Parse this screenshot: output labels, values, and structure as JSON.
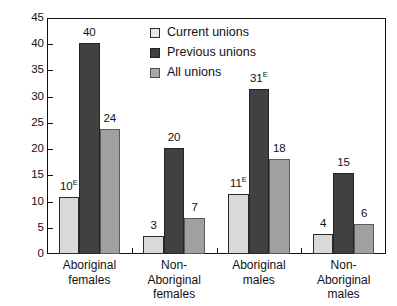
{
  "chart_data": {
    "type": "bar",
    "title": "",
    "subtitle": "",
    "xlabel": "",
    "ylabel": "",
    "ylim": [
      0,
      45
    ],
    "yticks": [
      0,
      5,
      10,
      15,
      20,
      25,
      30,
      35,
      40,
      45
    ],
    "grid": false,
    "legend_position": "top-center-inside",
    "categories": [
      "Aboriginal females",
      "Non-Aboriginal females",
      "Aboriginal males",
      "Non-Aboriginal males"
    ],
    "category_lines": [
      [
        "Aboriginal",
        "females"
      ],
      [
        "Non-",
        "Aboriginal",
        "females"
      ],
      [
        "Aboriginal",
        "males"
      ],
      [
        "Non-",
        "Aboriginal",
        "males"
      ]
    ],
    "series": [
      {
        "name": "Current unions",
        "color": "#d9d9d9",
        "values": [
          10.8,
          3.5,
          11.4,
          3.9
        ],
        "labels": [
          "10",
          "3",
          "11",
          "4"
        ],
        "label_superscripts": [
          "E",
          "",
          "E",
          ""
        ]
      },
      {
        "name": "Previous unions",
        "color": "#414141",
        "values": [
          40.2,
          20.3,
          31.4,
          15.4
        ],
        "labels": [
          "40",
          "20",
          "31",
          "15"
        ],
        "label_superscripts": [
          "",
          "",
          "E",
          ""
        ]
      },
      {
        "name": "All unions",
        "color": "#a0a0a0",
        "values": [
          23.8,
          6.9,
          18.2,
          5.7
        ],
        "labels": [
          "24",
          "7",
          "18",
          "6"
        ],
        "label_superscripts": [
          "",
          "",
          "",
          ""
        ]
      }
    ]
  }
}
